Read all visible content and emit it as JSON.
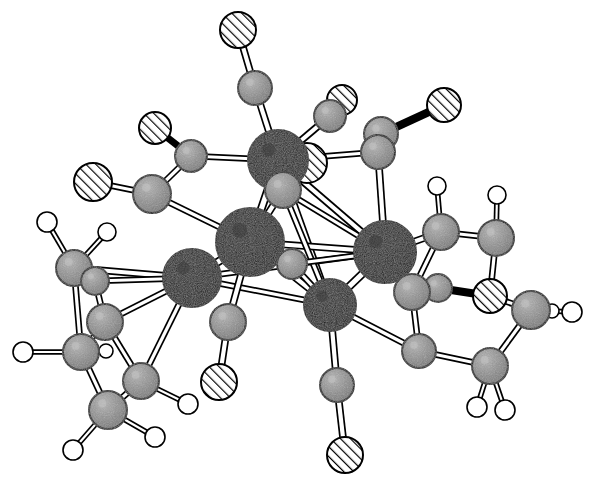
{
  "figure": {
    "caption": "",
    "background_color": "#ffffff",
    "width": 605,
    "height": 490
  },
  "legend": {
    "atom_styles": [
      {
        "key": "metal",
        "label": "Metal",
        "fill": "#0d0d0d",
        "stroke": "#000000",
        "radius": 27,
        "texture": "stipple-dark"
      },
      {
        "key": "carbon",
        "label": "Carbon",
        "fill": "#8a8a8a",
        "stroke": "#000000",
        "radius": 16,
        "texture": "stipple-gray"
      },
      {
        "key": "oxygen",
        "label": "Oxygen",
        "fill": "#ffffff",
        "stroke": "#000000",
        "radius": 17,
        "texture": "hatch-diagonal"
      },
      {
        "key": "hydrogen",
        "label": "Hydrogen",
        "fill": "#ffffff",
        "stroke": "#000000",
        "radius": 9,
        "texture": "plain"
      }
    ],
    "bond_styles": [
      {
        "key": "open",
        "label": "Open rod bond",
        "fill": "#ffffff",
        "stroke": "#000000"
      },
      {
        "key": "solid",
        "label": "Solid rod bond",
        "fill": "#000000",
        "stroke": "#000000"
      }
    ]
  },
  "structure": {
    "name": "organometallic carbonyl cluster",
    "atom_counts": {
      "metal": 5,
      "carbon": 27,
      "oxygen": 9,
      "hydrogen": 17
    },
    "atoms": [
      {
        "id": "M1",
        "type": "metal",
        "x": 278,
        "y": 160,
        "r": 30
      },
      {
        "id": "M2",
        "type": "metal",
        "x": 250,
        "y": 242,
        "r": 34
      },
      {
        "id": "M3",
        "type": "metal",
        "x": 192,
        "y": 278,
        "r": 29
      },
      {
        "id": "M4",
        "type": "metal",
        "x": 385,
        "y": 252,
        "r": 31
      },
      {
        "id": "M5",
        "type": "metal",
        "x": 330,
        "y": 305,
        "r": 26
      },
      {
        "id": "C1",
        "type": "carbon",
        "x": 255,
        "y": 88,
        "r": 17
      },
      {
        "id": "O1",
        "type": "oxygen",
        "x": 238,
        "y": 30,
        "r": 18
      },
      {
        "id": "C2",
        "type": "carbon",
        "x": 330,
        "y": 116,
        "r": 16
      },
      {
        "id": "O2",
        "type": "oxygen",
        "x": 342,
        "y": 100,
        "r": 15
      },
      {
        "id": "O3",
        "type": "oxygen",
        "x": 307,
        "y": 163,
        "r": 20
      },
      {
        "id": "C3",
        "type": "carbon",
        "x": 283,
        "y": 190,
        "r": 18
      },
      {
        "id": "C4",
        "type": "carbon",
        "x": 191,
        "y": 156,
        "r": 16
      },
      {
        "id": "O4",
        "type": "oxygen",
        "x": 155,
        "y": 128,
        "r": 16
      },
      {
        "id": "C5",
        "type": "carbon",
        "x": 152,
        "y": 194,
        "r": 19
      },
      {
        "id": "O5",
        "type": "oxygen",
        "x": 93,
        "y": 182,
        "r": 19
      },
      {
        "id": "C6",
        "type": "carbon",
        "x": 378,
        "y": 152,
        "r": 17
      },
      {
        "id": "C7",
        "type": "carbon",
        "x": 381,
        "y": 134,
        "r": 17
      },
      {
        "id": "O6",
        "type": "oxygen",
        "x": 444,
        "y": 105,
        "r": 17
      },
      {
        "id": "C8",
        "type": "carbon",
        "x": 228,
        "y": 322,
        "r": 18
      },
      {
        "id": "O7",
        "type": "oxygen",
        "x": 219,
        "y": 382,
        "r": 18
      },
      {
        "id": "C9",
        "type": "carbon",
        "x": 337,
        "y": 385,
        "r": 17
      },
      {
        "id": "O8",
        "type": "oxygen",
        "x": 345,
        "y": 455,
        "r": 18
      },
      {
        "id": "C10",
        "type": "carbon",
        "x": 292,
        "y": 264,
        "r": 15
      },
      {
        "id": "C11",
        "type": "carbon",
        "x": 441,
        "y": 232,
        "r": 18
      },
      {
        "id": "C12",
        "type": "carbon",
        "x": 496,
        "y": 238,
        "r": 18
      },
      {
        "id": "C13",
        "type": "carbon",
        "x": 412,
        "y": 292,
        "r": 18
      },
      {
        "id": "C14",
        "type": "carbon",
        "x": 438,
        "y": 288,
        "r": 14
      },
      {
        "id": "O9",
        "type": "oxygen",
        "x": 490,
        "y": 296,
        "r": 17
      },
      {
        "id": "C15",
        "type": "carbon",
        "x": 531,
        "y": 310,
        "r": 19
      },
      {
        "id": "C16",
        "type": "carbon",
        "x": 419,
        "y": 351,
        "r": 17
      },
      {
        "id": "C17",
        "type": "carbon",
        "x": 490,
        "y": 366,
        "r": 18
      },
      {
        "id": "H1",
        "type": "hydrogen",
        "x": 437,
        "y": 186,
        "r": 9
      },
      {
        "id": "H2",
        "type": "hydrogen",
        "x": 497,
        "y": 195,
        "r": 9
      },
      {
        "id": "H3",
        "type": "hydrogen",
        "x": 572,
        "y": 312,
        "r": 10
      },
      {
        "id": "H4",
        "type": "hydrogen",
        "x": 552,
        "y": 311,
        "r": 7
      },
      {
        "id": "H5",
        "type": "hydrogen",
        "x": 477,
        "y": 407,
        "r": 10
      },
      {
        "id": "H6",
        "type": "hydrogen",
        "x": 505,
        "y": 410,
        "r": 10
      },
      {
        "id": "C18",
        "type": "carbon",
        "x": 74,
        "y": 268,
        "r": 18
      },
      {
        "id": "C19",
        "type": "carbon",
        "x": 95,
        "y": 281,
        "r": 14
      },
      {
        "id": "C20",
        "type": "carbon",
        "x": 105,
        "y": 322,
        "r": 18
      },
      {
        "id": "C21",
        "type": "carbon",
        "x": 81,
        "y": 352,
        "r": 18
      },
      {
        "id": "C22",
        "type": "carbon",
        "x": 141,
        "y": 381,
        "r": 18
      },
      {
        "id": "C23",
        "type": "carbon",
        "x": 108,
        "y": 410,
        "r": 19
      },
      {
        "id": "H7",
        "type": "hydrogen",
        "x": 47,
        "y": 222,
        "r": 10
      },
      {
        "id": "H8",
        "type": "hydrogen",
        "x": 107,
        "y": 232,
        "r": 9
      },
      {
        "id": "H9",
        "type": "hydrogen",
        "x": 23,
        "y": 352,
        "r": 10
      },
      {
        "id": "H10",
        "type": "hydrogen",
        "x": 106,
        "y": 351,
        "r": 7
      },
      {
        "id": "H11",
        "type": "hydrogen",
        "x": 188,
        "y": 404,
        "r": 10
      },
      {
        "id": "H12",
        "type": "hydrogen",
        "x": 155,
        "y": 437,
        "r": 10
      },
      {
        "id": "H13",
        "type": "hydrogen",
        "x": 73,
        "y": 450,
        "r": 10
      }
    ],
    "bonds": [
      {
        "a": "M1",
        "b": "M2",
        "style": "open",
        "w": 7
      },
      {
        "a": "M1",
        "b": "M4",
        "style": "open",
        "w": 6
      },
      {
        "a": "M1",
        "b": "M5",
        "style": "open",
        "w": 6
      },
      {
        "a": "M2",
        "b": "M3",
        "style": "open",
        "w": 7
      },
      {
        "a": "M2",
        "b": "M5",
        "style": "open",
        "w": 6
      },
      {
        "a": "M2",
        "b": "M4",
        "style": "open",
        "w": 6
      },
      {
        "a": "M3",
        "b": "M5",
        "style": "open",
        "w": 5
      },
      {
        "a": "M3",
        "b": "M4",
        "style": "open",
        "w": 5
      },
      {
        "a": "M4",
        "b": "M5",
        "style": "open",
        "w": 7
      },
      {
        "a": "M1",
        "b": "C1",
        "style": "open",
        "w": 6
      },
      {
        "a": "C1",
        "b": "O1",
        "style": "open",
        "w": 6
      },
      {
        "a": "M1",
        "b": "C2",
        "style": "open",
        "w": 6
      },
      {
        "a": "C2",
        "b": "O2",
        "style": "open",
        "w": 5
      },
      {
        "a": "M1",
        "b": "C3",
        "style": "open",
        "w": 6
      },
      {
        "a": "M1",
        "b": "C4",
        "style": "open",
        "w": 5
      },
      {
        "a": "C4",
        "b": "O4",
        "style": "solid",
        "w": 5
      },
      {
        "a": "C4",
        "b": "C5",
        "style": "open",
        "w": 5
      },
      {
        "a": "C5",
        "b": "O5",
        "style": "open",
        "w": 5
      },
      {
        "a": "C5",
        "b": "M2",
        "style": "open",
        "w": 5
      },
      {
        "a": "M1",
        "b": "C6",
        "style": "open",
        "w": 5
      },
      {
        "a": "C6",
        "b": "C7",
        "style": "open",
        "w": 5
      },
      {
        "a": "C7",
        "b": "O6",
        "style": "solid",
        "w": 6
      },
      {
        "a": "C6",
        "b": "M4",
        "style": "open",
        "w": 6
      },
      {
        "a": "C3",
        "b": "M2",
        "style": "open",
        "w": 6
      },
      {
        "a": "C3",
        "b": "M5",
        "style": "open",
        "w": 5
      },
      {
        "a": "C3",
        "b": "M4",
        "style": "open",
        "w": 5
      },
      {
        "a": "M2",
        "b": "C8",
        "style": "open",
        "w": 6
      },
      {
        "a": "C8",
        "b": "O7",
        "style": "open",
        "w": 6
      },
      {
        "a": "M5",
        "b": "C9",
        "style": "open",
        "w": 6
      },
      {
        "a": "C9",
        "b": "O8",
        "style": "open",
        "w": 6
      },
      {
        "a": "M2",
        "b": "C10",
        "style": "open",
        "w": 5
      },
      {
        "a": "C10",
        "b": "M5",
        "style": "open",
        "w": 5
      },
      {
        "a": "C10",
        "b": "M4",
        "style": "open",
        "w": 5
      },
      {
        "a": "M4",
        "b": "C11",
        "style": "open",
        "w": 6
      },
      {
        "a": "C11",
        "b": "H1",
        "style": "open",
        "w": 4
      },
      {
        "a": "C11",
        "b": "C12",
        "style": "open",
        "w": 5
      },
      {
        "a": "C12",
        "b": "H2",
        "style": "open",
        "w": 4
      },
      {
        "a": "C12",
        "b": "O9",
        "style": "open",
        "w": 5
      },
      {
        "a": "M4",
        "b": "C13",
        "style": "open",
        "w": 6
      },
      {
        "a": "C13",
        "b": "C11",
        "style": "open",
        "w": 5
      },
      {
        "a": "C13",
        "b": "C14",
        "style": "open",
        "w": 4
      },
      {
        "a": "C14",
        "b": "O9",
        "style": "solid",
        "w": 6
      },
      {
        "a": "O9",
        "b": "C15",
        "style": "open",
        "w": 5
      },
      {
        "a": "C15",
        "b": "H3",
        "style": "open",
        "w": 4
      },
      {
        "a": "C15",
        "b": "H4",
        "style": "open",
        "w": 4
      },
      {
        "a": "C13",
        "b": "C16",
        "style": "open",
        "w": 5
      },
      {
        "a": "C16",
        "b": "C17",
        "style": "open",
        "w": 5
      },
      {
        "a": "C17",
        "b": "C15",
        "style": "open",
        "w": 5
      },
      {
        "a": "C17",
        "b": "H5",
        "style": "open",
        "w": 4
      },
      {
        "a": "C17",
        "b": "H6",
        "style": "open",
        "w": 4
      },
      {
        "a": "C16",
        "b": "M5",
        "style": "open",
        "w": 5
      },
      {
        "a": "M3",
        "b": "C18",
        "style": "open",
        "w": 6
      },
      {
        "a": "M3",
        "b": "C19",
        "style": "open",
        "w": 5
      },
      {
        "a": "C18",
        "b": "H7",
        "style": "open",
        "w": 4
      },
      {
        "a": "C18",
        "b": "H8",
        "style": "open",
        "w": 4
      },
      {
        "a": "C18",
        "b": "C19",
        "style": "open",
        "w": 4
      },
      {
        "a": "C19",
        "b": "C20",
        "style": "open",
        "w": 5
      },
      {
        "a": "C18",
        "b": "C21",
        "style": "open",
        "w": 5
      },
      {
        "a": "C21",
        "b": "H9",
        "style": "open",
        "w": 4
      },
      {
        "a": "C21",
        "b": "H10",
        "style": "open",
        "w": 4
      },
      {
        "a": "C20",
        "b": "M3",
        "style": "open",
        "w": 5
      },
      {
        "a": "C20",
        "b": "C22",
        "style": "open",
        "w": 5
      },
      {
        "a": "C22",
        "b": "M3",
        "style": "open",
        "w": 5
      },
      {
        "a": "C22",
        "b": "H11",
        "style": "open",
        "w": 4
      },
      {
        "a": "C21",
        "b": "C23",
        "style": "open",
        "w": 5
      },
      {
        "a": "C23",
        "b": "C22",
        "style": "open",
        "w": 5
      },
      {
        "a": "C23",
        "b": "H12",
        "style": "open",
        "w": 4
      },
      {
        "a": "C23",
        "b": "H13",
        "style": "open",
        "w": 4
      },
      {
        "a": "C20",
        "b": "C21",
        "style": "open",
        "w": 4
      }
    ]
  }
}
